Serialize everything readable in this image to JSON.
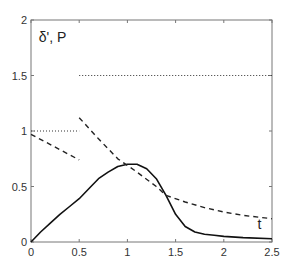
{
  "chart_data": {
    "type": "line",
    "title": "",
    "xlabel": "t",
    "ylabel": "δ', P",
    "xlim": [
      0,
      2.5
    ],
    "ylim": [
      0,
      2
    ],
    "grid": false,
    "xticks": [
      "0",
      "0.5",
      "1",
      "1.5",
      "2",
      "2.5"
    ],
    "yticks": [
      "0",
      "0.5",
      "1",
      "1.5",
      "2"
    ],
    "series": [
      {
        "name": "P (solid)",
        "style": "solid",
        "x": [
          0,
          0.1,
          0.2,
          0.3,
          0.4,
          0.5,
          0.6,
          0.7,
          0.8,
          0.9,
          1.0,
          1.1,
          1.2,
          1.3,
          1.4,
          1.5,
          1.6,
          1.7,
          1.8,
          1.9,
          2.0,
          2.2,
          2.5
        ],
        "y": [
          0,
          0.09,
          0.17,
          0.25,
          0.32,
          0.39,
          0.48,
          0.57,
          0.63,
          0.68,
          0.7,
          0.7,
          0.66,
          0.57,
          0.42,
          0.25,
          0.14,
          0.09,
          0.07,
          0.06,
          0.05,
          0.04,
          0.03
        ]
      },
      {
        "name": "δ' segment 1 (dashed)",
        "style": "dashed",
        "x": [
          0,
          0.5
        ],
        "y": [
          0.97,
          0.74
        ]
      },
      {
        "name": "δ' segment 2 (dashed)",
        "style": "dashed",
        "x": [
          0.5,
          0.7,
          0.9,
          1.1,
          1.3,
          1.4,
          1.6,
          1.8,
          2.0,
          2.2,
          2.5
        ],
        "y": [
          1.12,
          0.93,
          0.75,
          0.63,
          0.5,
          0.42,
          0.36,
          0.31,
          0.27,
          0.24,
          0.21
        ]
      },
      {
        "name": "threshold 1 (dotted)",
        "style": "dotted",
        "x": [
          0,
          0.5
        ],
        "y": [
          1.0,
          1.0
        ]
      },
      {
        "name": "threshold 2 (dotted)",
        "style": "dotted",
        "x": [
          0.5,
          2.5
        ],
        "y": [
          1.5,
          1.5
        ]
      }
    ],
    "annotations": [
      {
        "text": "δ', P",
        "x": 0.08,
        "y": 1.8
      },
      {
        "text": "t",
        "x": 2.35,
        "y": 0.12
      }
    ]
  }
}
